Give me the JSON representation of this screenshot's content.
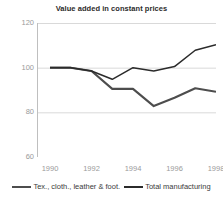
{
  "chart_data": {
    "type": "line",
    "title": "Value added in constant prices",
    "xlabel": "",
    "ylabel": "",
    "x": [
      1990,
      1991,
      1992,
      1993,
      1994,
      1995,
      1996,
      1997,
      1998
    ],
    "xlim": [
      1990,
      1998
    ],
    "ylim": [
      60,
      120
    ],
    "yticks": [
      60,
      80,
      100,
      120
    ],
    "ytick_labels": [
      "60",
      "80",
      "100",
      "120"
    ],
    "xticks": [
      1990,
      1992,
      1994,
      1996,
      1998
    ],
    "xtick_labels": [
      "1990",
      "1992",
      "1994",
      "1996",
      "1998"
    ],
    "grid": "horizontal",
    "legend_position": "bottom",
    "series": [
      {
        "name": "Tex., cloth., leather & foot.",
        "color": "#4d4d4d",
        "values": [
          100,
          100,
          98.5,
          90.5,
          90.5,
          82.8,
          86.5,
          90.8,
          89.2
        ]
      },
      {
        "name": "Total manufacturing",
        "color": "#2b2b2b",
        "values": [
          100,
          100,
          98.5,
          94.8,
          100,
          98.5,
          100.5,
          107.8,
          110.3
        ]
      }
    ]
  },
  "axis_color": "#bfbfbf",
  "grid_color": "#d9d9d9",
  "tick_label_color": "#9a9a9a"
}
